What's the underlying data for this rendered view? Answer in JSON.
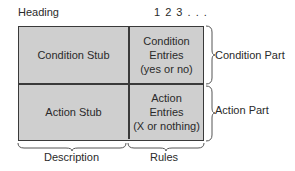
{
  "heading": "Heading",
  "rule_numbers": "1 2 3 . . .",
  "table": {
    "condition_stub": "Condition Stub",
    "condition_entries": [
      "Condition",
      "Entries",
      "(yes or no)"
    ],
    "action_stub": "Action Stub",
    "action_entries": [
      "Action",
      "Entries",
      "(X or nothing)"
    ]
  },
  "brace_labels": {
    "condition_part": "Condition Part",
    "action_part": "Action Part",
    "description": "Description",
    "rules": "Rules"
  },
  "colors": {
    "cell_fill": "#cfcfcf",
    "border": "#3a3a3a"
  }
}
